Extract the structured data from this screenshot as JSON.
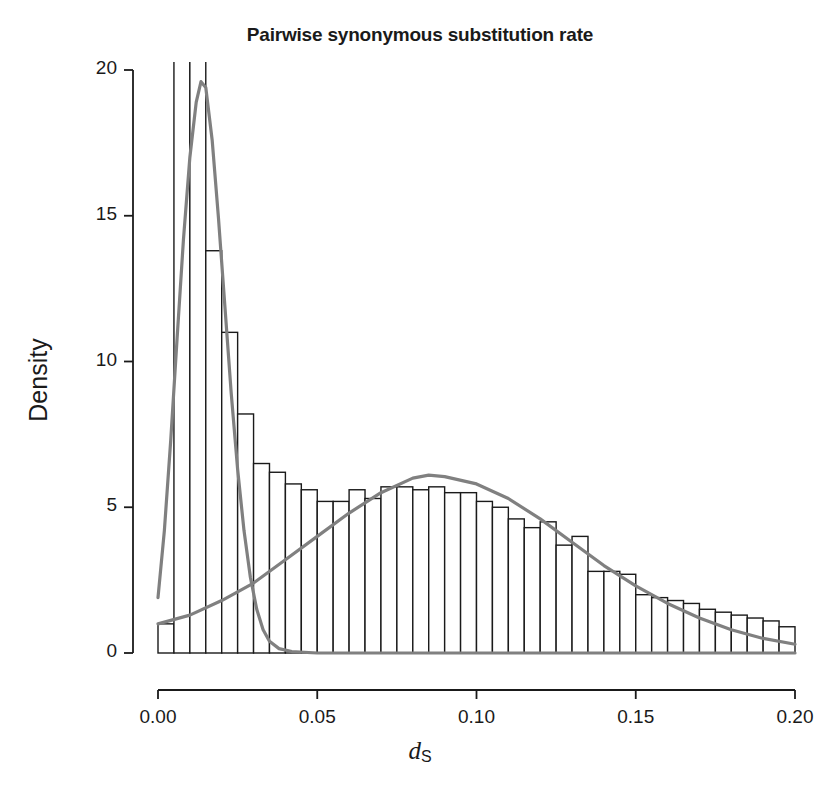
{
  "chart_data": {
    "type": "bar",
    "title": "Pairwise synonymous substitution rate",
    "xlabel": "dS",
    "xlabel_base": "d",
    "xlabel_sub": "S",
    "ylabel": "Density",
    "xlim": [
      0.0,
      0.2
    ],
    "ylim": [
      0.0,
      20.0
    ],
    "grid": false,
    "legend": "none",
    "bin_width": 0.005,
    "x_ticks": [
      0.0,
      0.05,
      0.1,
      0.15,
      0.2
    ],
    "x_tick_labels": [
      "0.00",
      "0.05",
      "0.10",
      "0.15",
      "0.20"
    ],
    "y_ticks": [
      0,
      5,
      10,
      15,
      20
    ],
    "y_tick_labels": [
      "0",
      "5",
      "10",
      "15",
      "20"
    ],
    "categories": [
      "0.000-0.005",
      "0.005-0.010",
      "0.010-0.015",
      "0.015-0.020",
      "0.020-0.025",
      "0.025-0.030",
      "0.030-0.035",
      "0.035-0.040",
      "0.040-0.045",
      "0.045-0.050",
      "0.050-0.055",
      "0.055-0.060",
      "0.060-0.065",
      "0.065-0.070",
      "0.070-0.075",
      "0.075-0.080",
      "0.080-0.085",
      "0.085-0.090",
      "0.090-0.095",
      "0.095-0.100",
      "0.100-0.105",
      "0.105-0.110",
      "0.110-0.115",
      "0.115-0.120",
      "0.120-0.125",
      "0.125-0.130",
      "0.130-0.135",
      "0.135-0.140",
      "0.140-0.145",
      "0.145-0.150",
      "0.150-0.155",
      "0.155-0.160",
      "0.160-0.165",
      "0.165-0.170",
      "0.170-0.175",
      "0.175-0.180",
      "0.180-0.185",
      "0.185-0.190",
      "0.190-0.195",
      "0.195-0.200"
    ],
    "values": [
      1.0,
      24.0,
      23.5,
      13.8,
      11.0,
      8.2,
      6.5,
      6.2,
      5.8,
      5.6,
      5.2,
      5.2,
      5.6,
      5.3,
      5.7,
      5.7,
      5.6,
      5.7,
      5.5,
      5.5,
      5.2,
      5.0,
      4.6,
      4.3,
      4.5,
      3.7,
      4.0,
      2.8,
      2.8,
      2.7,
      2.0,
      1.9,
      1.8,
      1.7,
      1.5,
      1.4,
      1.3,
      1.2,
      1.1,
      0.9
    ],
    "bar_fill": "#ffffff",
    "bar_stroke": "#1a1a1a",
    "overlay_curves": [
      {
        "name": "narrow-peak-density-curve",
        "color": "#808080",
        "description": "sharp unimodal curve peaking near dS=0.014 at density 19.6",
        "points": [
          [
            0.0,
            1.9
          ],
          [
            0.002,
            4.2
          ],
          [
            0.004,
            7.3
          ],
          [
            0.006,
            10.8
          ],
          [
            0.008,
            14.2
          ],
          [
            0.01,
            17.0
          ],
          [
            0.012,
            18.9
          ],
          [
            0.0135,
            19.6
          ],
          [
            0.015,
            19.4
          ],
          [
            0.017,
            17.6
          ],
          [
            0.019,
            14.9
          ],
          [
            0.021,
            11.9
          ],
          [
            0.023,
            8.9
          ],
          [
            0.025,
            6.3
          ],
          [
            0.027,
            4.2
          ],
          [
            0.029,
            2.6
          ],
          [
            0.031,
            1.5
          ],
          [
            0.033,
            0.8
          ],
          [
            0.035,
            0.4
          ],
          [
            0.038,
            0.15
          ],
          [
            0.042,
            0.05
          ],
          [
            0.05,
            0.0
          ],
          [
            0.2,
            0.0
          ]
        ]
      },
      {
        "name": "broad-normal-density-curve",
        "color": "#808080",
        "description": "broad bell curve peaking near dS=0.085 at density 6.1",
        "points": [
          [
            0.0,
            1.0
          ],
          [
            0.01,
            1.3
          ],
          [
            0.02,
            1.8
          ],
          [
            0.03,
            2.4
          ],
          [
            0.04,
            3.2
          ],
          [
            0.05,
            4.0
          ],
          [
            0.06,
            4.8
          ],
          [
            0.07,
            5.5
          ],
          [
            0.08,
            6.0
          ],
          [
            0.085,
            6.1
          ],
          [
            0.09,
            6.05
          ],
          [
            0.1,
            5.8
          ],
          [
            0.11,
            5.3
          ],
          [
            0.12,
            4.6
          ],
          [
            0.13,
            3.8
          ],
          [
            0.14,
            3.0
          ],
          [
            0.15,
            2.3
          ],
          [
            0.16,
            1.7
          ],
          [
            0.17,
            1.2
          ],
          [
            0.18,
            0.8
          ],
          [
            0.19,
            0.5
          ],
          [
            0.2,
            0.3
          ]
        ]
      }
    ],
    "axis_color": "#1a1a1a",
    "background": "#ffffff"
  }
}
